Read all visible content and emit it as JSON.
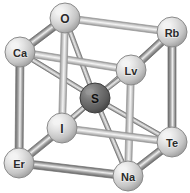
{
  "figure": {
    "background_color": "#ffffff",
    "width": 190,
    "height": 193
  },
  "colors": {
    "corner_atom_fill": "#d8d8d8",
    "corner_atom_highlight": "#f2f2f2",
    "corner_atom_rim": "#8a8a8a",
    "center_atom_fill": "#6a6a6a",
    "center_atom_highlight": "#9a9a9a",
    "center_atom_rim": "#3d3d3d",
    "label_color_light_atom": "#2b2b2b",
    "label_color_dark_atom": "#1a1a1a",
    "bond_front": "#8f8f8f",
    "bond_back": "#bdbdbd",
    "bond_highlight": "#efefef",
    "bond_outline": "#6e6e6e",
    "diagonal_bond": "#b4b4b4"
  },
  "atoms": [
    {
      "id": "a-o",
      "label": "O",
      "x": 65,
      "y": 18,
      "r": 15,
      "type": "corner",
      "name": "atom-o"
    },
    {
      "id": "a-rb",
      "label": "Rb",
      "x": 172,
      "y": 32,
      "r": 15,
      "type": "corner",
      "name": "atom-rb"
    },
    {
      "id": "a-ca",
      "label": "Ca",
      "x": 20,
      "y": 52,
      "r": 15,
      "type": "corner",
      "name": "atom-ca"
    },
    {
      "id": "a-lv",
      "label": "Lv",
      "x": 131,
      "y": 70,
      "r": 15,
      "type": "corner",
      "name": "atom-lv"
    },
    {
      "id": "a-s",
      "label": "S",
      "x": 95,
      "y": 98,
      "r": 15,
      "type": "center",
      "name": "atom-s"
    },
    {
      "id": "a-i",
      "label": "I",
      "x": 62,
      "y": 128,
      "r": 15,
      "type": "corner",
      "name": "atom-i"
    },
    {
      "id": "a-te",
      "label": "Te",
      "x": 172,
      "y": 142,
      "r": 15,
      "type": "corner",
      "name": "atom-te"
    },
    {
      "id": "a-er",
      "label": "Er",
      "x": 19,
      "y": 163,
      "r": 15,
      "type": "corner",
      "name": "atom-er"
    },
    {
      "id": "a-na",
      "label": "Na",
      "x": 128,
      "y": 176,
      "r": 15,
      "type": "corner",
      "name": "atom-na"
    }
  ],
  "edge_bonds": [
    {
      "from": "a-ca",
      "to": "a-o",
      "depth": "front",
      "width": 8,
      "name": "bond-ca-o"
    },
    {
      "from": "a-o",
      "to": "a-rb",
      "depth": "back",
      "width": 7,
      "name": "bond-o-rb"
    },
    {
      "from": "a-ca",
      "to": "a-lv",
      "depth": "back",
      "width": 7,
      "name": "bond-ca-lv"
    },
    {
      "from": "a-lv",
      "to": "a-rb",
      "depth": "front",
      "width": 8,
      "name": "bond-lv-rb"
    },
    {
      "from": "a-ca",
      "to": "a-er",
      "depth": "front",
      "width": 8,
      "name": "bond-ca-er"
    },
    {
      "from": "a-o",
      "to": "a-i",
      "depth": "back",
      "width": 7,
      "name": "bond-o-i"
    },
    {
      "from": "a-rb",
      "to": "a-te",
      "depth": "front",
      "width": 8,
      "name": "bond-rb-te"
    },
    {
      "from": "a-lv",
      "to": "a-na",
      "depth": "back",
      "width": 7,
      "name": "bond-lv-na"
    },
    {
      "from": "a-er",
      "to": "a-i",
      "depth": "front",
      "width": 8,
      "name": "bond-er-i"
    },
    {
      "from": "a-i",
      "to": "a-te",
      "depth": "back",
      "width": 7,
      "name": "bond-i-te"
    },
    {
      "from": "a-er",
      "to": "a-na",
      "depth": "front",
      "width": 8,
      "name": "bond-er-na"
    },
    {
      "from": "a-na",
      "to": "a-te",
      "depth": "front",
      "width": 8,
      "name": "bond-na-te"
    }
  ],
  "center_bonds": [
    {
      "from": "a-s",
      "to": "a-o",
      "name": "bond-s-o"
    },
    {
      "from": "a-s",
      "to": "a-rb",
      "name": "bond-s-rb"
    },
    {
      "from": "a-s",
      "to": "a-ca",
      "name": "bond-s-ca"
    },
    {
      "from": "a-s",
      "to": "a-lv",
      "name": "bond-s-lv"
    },
    {
      "from": "a-s",
      "to": "a-i",
      "name": "bond-s-i"
    },
    {
      "from": "a-s",
      "to": "a-te",
      "name": "bond-s-te"
    },
    {
      "from": "a-s",
      "to": "a-er",
      "name": "bond-s-er"
    },
    {
      "from": "a-s",
      "to": "a-na",
      "name": "bond-s-na"
    }
  ]
}
